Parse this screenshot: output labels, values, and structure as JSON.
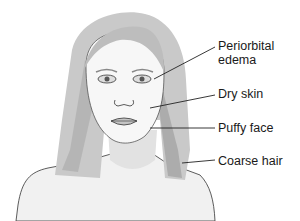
{
  "diagram": {
    "labels": [
      {
        "text1": "Periorbital",
        "text2": "edema"
      },
      {
        "text1": "Dry skin"
      },
      {
        "text1": "Puffy face"
      },
      {
        "text1": "Coarse hair"
      }
    ]
  }
}
